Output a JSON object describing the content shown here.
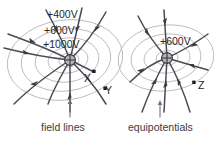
{
  "figure": {
    "background_color": "#ffffff",
    "equipotential_color": "#b9b9b9",
    "fieldline_color": "#4a4a54",
    "charge_fill_color": "#b5b5b5",
    "marker_color": "#1d1d22"
  },
  "left_diagram": {
    "charge_symbol": "positive-charge",
    "equipotential_labels": [
      {
        "id": "v400",
        "text": "+400V"
      },
      {
        "id": "v600",
        "text": "+600V"
      },
      {
        "id": "v1000",
        "text": "+1000V"
      }
    ],
    "points": [
      {
        "id": "x",
        "text": "X"
      },
      {
        "id": "y",
        "text": "Y"
      }
    ],
    "caption": "field lines"
  },
  "right_diagram": {
    "charge_symbol": "positive-charge",
    "equipotential_labels": [
      {
        "id": "v600r",
        "text": "+600V"
      }
    ],
    "points": [
      {
        "id": "z",
        "text": "Z"
      }
    ],
    "caption": "equipotentials"
  }
}
